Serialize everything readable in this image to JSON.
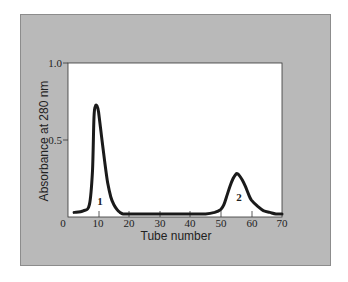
{
  "chart_data": {
    "type": "line",
    "title": "",
    "xlabel": "Tube number",
    "ylabel": "Absorbance at 280 nm",
    "xlim": [
      0,
      70
    ],
    "ylim": [
      0,
      1.0
    ],
    "x_ticks": [
      0,
      10,
      20,
      30,
      40,
      50,
      60,
      70
    ],
    "x_tick_labels": [
      "0",
      "10",
      "20",
      "30",
      "40",
      "50",
      "60",
      "70"
    ],
    "y_ticks": [
      0.5,
      1.0
    ],
    "y_tick_labels": [
      "0.5",
      "1.0"
    ],
    "grid": false,
    "legend": null,
    "series": [
      {
        "name": "Absorbance",
        "x": [
          2,
          5,
          7,
          8,
          8.5,
          9,
          9.5,
          10,
          11,
          12,
          13,
          14,
          15,
          16,
          17,
          18,
          20,
          25,
          30,
          40,
          45,
          48,
          50,
          51,
          52,
          53,
          54,
          55,
          55.5,
          56,
          57,
          58,
          59,
          60,
          62,
          64,
          66,
          68,
          70
        ],
        "y": [
          0.03,
          0.04,
          0.08,
          0.3,
          0.65,
          0.72,
          0.72,
          0.68,
          0.52,
          0.36,
          0.22,
          0.13,
          0.08,
          0.05,
          0.03,
          0.02,
          0.02,
          0.02,
          0.02,
          0.02,
          0.02,
          0.03,
          0.05,
          0.08,
          0.14,
          0.2,
          0.25,
          0.28,
          0.28,
          0.27,
          0.24,
          0.2,
          0.15,
          0.11,
          0.07,
          0.04,
          0.03,
          0.02,
          0.02
        ]
      }
    ],
    "annotations": [
      {
        "text": "1",
        "x": 10,
        "y": 0.07
      },
      {
        "text": "2",
        "x": 55,
        "y": 0.1
      }
    ],
    "peaks": [
      {
        "label": "1",
        "tube": 9,
        "absorbance": 0.72
      },
      {
        "label": "2",
        "tube": 55.5,
        "absorbance": 0.28
      }
    ]
  },
  "axes": {
    "x_label": "Tube number",
    "y_label": "Absorbance at 280 nm",
    "x_ticks": [
      "0",
      "10",
      "20",
      "30",
      "40",
      "50",
      "60",
      "70"
    ],
    "y_ticks": [
      "0.5",
      "1.0"
    ]
  },
  "annotations": {
    "peak1": "1",
    "peak2": "2"
  },
  "colors": {
    "panel_background": "#b9b9b9",
    "plot_background": "#ffffff",
    "curve": "#1a1a1a"
  }
}
